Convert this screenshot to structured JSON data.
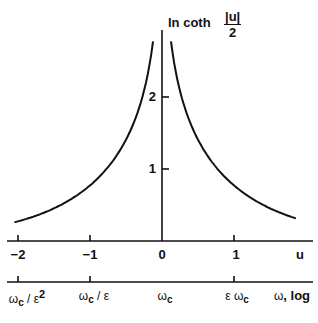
{
  "chart_data": {
    "type": "line",
    "title": "",
    "ylabel": {
      "prefix": "ln coth",
      "frac_num": "|u|",
      "frac_den": "2"
    },
    "xlabel": "u",
    "function": "ln coth(|u|/2)",
    "xlim": [
      -2.1,
      2.1
    ],
    "ylim": [
      0,
      3
    ],
    "grid": false,
    "legend": null,
    "x_ticks": [
      {
        "value": -2,
        "label": "−2"
      },
      {
        "value": -1,
        "label": "−1"
      },
      {
        "value": 0,
        "label": "0"
      },
      {
        "value": 1,
        "label": "1"
      }
    ],
    "y_ticks": [
      {
        "value": 1,
        "label": "1"
      },
      {
        "value": 2,
        "label": "2"
      }
    ],
    "secondary_x_axis": {
      "label": {
        "omega": "ω",
        "text": ", log"
      },
      "ticks": [
        {
          "value": -2,
          "omega": "ω",
          "sub": "c",
          "text": " / ε",
          "sup": "2"
        },
        {
          "value": -1,
          "omega": "ω",
          "sub": "c",
          "text": " / ε",
          "sup": ""
        },
        {
          "value": 0,
          "omega": "ω",
          "sub": "c",
          "text": "",
          "sup": "",
          "no_tick": true
        },
        {
          "value": 1,
          "prefix": "ε ",
          "omega": "ω",
          "sub": "c",
          "text": "",
          "sup": ""
        }
      ]
    },
    "series": [
      {
        "name": "left branch",
        "x": [
          -2.05,
          -1.8,
          -1.5,
          -1.2,
          -1.0,
          -0.8,
          -0.6,
          -0.45,
          -0.3,
          -0.2,
          -0.125
        ],
        "y": [
          0.25,
          0.33,
          0.45,
          0.62,
          0.77,
          0.97,
          1.24,
          1.51,
          1.91,
          2.3,
          2.77
        ]
      },
      {
        "name": "right branch",
        "x": [
          0.125,
          0.2,
          0.3,
          0.45,
          0.6,
          0.8,
          1.0,
          1.2,
          1.5,
          1.86
        ],
        "y": [
          2.77,
          2.3,
          1.91,
          1.51,
          1.24,
          0.97,
          0.77,
          0.62,
          0.45,
          0.31
        ]
      }
    ]
  }
}
